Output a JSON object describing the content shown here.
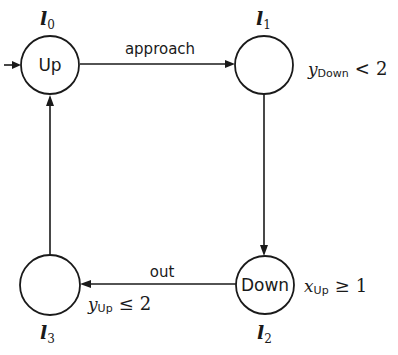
{
  "diagram": {
    "type": "timed-automaton",
    "locations": [
      {
        "id": "l0",
        "name_base": "l",
        "name_sub": "0",
        "label": "Up",
        "initial": true,
        "invariant": null
      },
      {
        "id": "l1",
        "name_base": "l",
        "name_sub": "1",
        "label": "",
        "initial": false,
        "invariant": {
          "var": "y",
          "sub": "Down",
          "op": "<",
          "value": "2"
        }
      },
      {
        "id": "l2",
        "name_base": "l",
        "name_sub": "2",
        "label": "Down",
        "initial": false,
        "invariant": {
          "var": "x",
          "sub": "Up",
          "op": "≥",
          "value": "1"
        }
      },
      {
        "id": "l3",
        "name_base": "l",
        "name_sub": "3",
        "label": "",
        "initial": false,
        "invariant": {
          "var": "y",
          "sub": "Up",
          "op": "≤",
          "value": "2"
        }
      }
    ],
    "edges": [
      {
        "from": "l0",
        "to": "l1",
        "label": "approach"
      },
      {
        "from": "l1",
        "to": "l2",
        "label": ""
      },
      {
        "from": "l2",
        "to": "l3",
        "label": "out"
      },
      {
        "from": "l3",
        "to": "l0",
        "label": ""
      }
    ]
  }
}
